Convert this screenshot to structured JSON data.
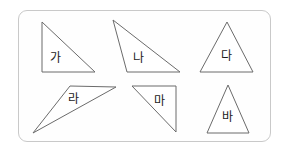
{
  "worksheet": {
    "title": "Triangle identification worksheet",
    "panel": {
      "name": "figure-panel",
      "border_color": "#c9c9c9",
      "background_color": "#fefefe",
      "x": 18,
      "y": 10,
      "width": 253,
      "height": 132,
      "corner_radius": 9
    },
    "stroke_color": "#6b6b6b",
    "fill_color": "#ffffff",
    "label_color": "#1a1a1a"
  },
  "figures": [
    {
      "id": "ga",
      "label": "가",
      "type": "right-triangle",
      "points": "42,22 42,72 95,72",
      "label_x": 50,
      "label_y": 52
    },
    {
      "id": "na",
      "label": "나",
      "type": "obtuse-scalene-triangle",
      "points": "113,20 127,72 180,72",
      "label_x": 133,
      "label_y": 52
    },
    {
      "id": "da",
      "label": "다",
      "type": "isosceles-triangle",
      "points": "227,22 200,72 253,72",
      "label_x": 221,
      "label_y": 50
    },
    {
      "id": "ra",
      "label": "라",
      "type": "thin-sliver-triangle",
      "points": "70,86 116,87 33,133",
      "label_x": 68,
      "label_y": 93
    },
    {
      "id": "ma",
      "label": "마",
      "type": "right-triangle",
      "points": "132,86 176,86 176,132",
      "label_x": 154,
      "label_y": 95
    },
    {
      "id": "ba",
      "label": "바",
      "type": "isosceles-triangle",
      "points": "228,85 207,133 249,133",
      "label_x": 222,
      "label_y": 111
    }
  ]
}
